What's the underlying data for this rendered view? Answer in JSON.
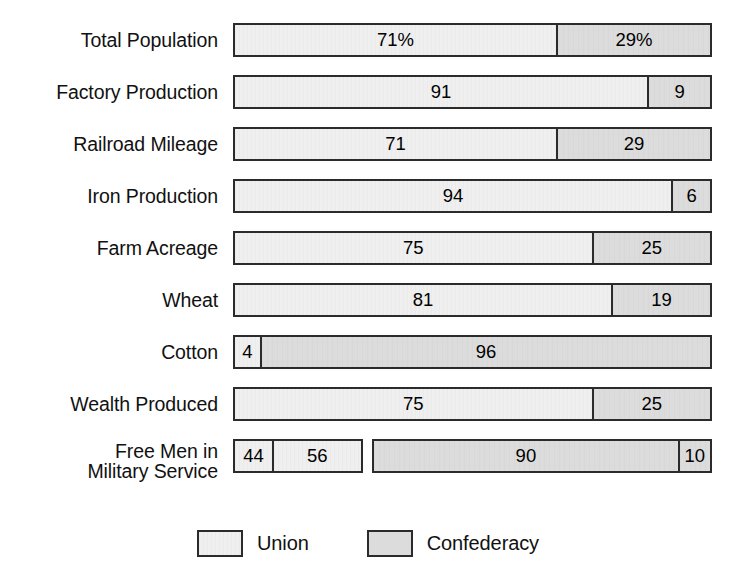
{
  "chart_data": {
    "type": "bar",
    "subtype": "stacked-horizontal-100-percent",
    "title": "",
    "xlabel": "",
    "ylabel": "",
    "xlim": [
      0,
      100
    ],
    "grid": false,
    "legend_position": "bottom-center",
    "units": "percent",
    "categories": [
      "Total Population",
      "Factory Production",
      "Railroad Mileage",
      "Iron Production",
      "Farm Acreage",
      "Wheat",
      "Cotton",
      "Wealth Produced",
      "Free Men in\nMilitary Service"
    ],
    "series": [
      {
        "name": "Union",
        "color": "#efefef",
        "values": [
          71,
          91,
          71,
          94,
          75,
          81,
          4,
          75,
          44
        ]
      },
      {
        "name": "Confederacy",
        "color": "#dcdcdc",
        "values": [
          29,
          9,
          29,
          6,
          25,
          19,
          96,
          25,
          56
        ]
      }
    ],
    "legend": [
      {
        "label": "Union",
        "color": "#efefef"
      },
      {
        "label": "Confederacy",
        "color": "#dcdcdc"
      }
    ]
  },
  "rows": [
    {
      "label": "Total Population",
      "groups": [
        {
          "start_pct": 0,
          "width_pct": 100,
          "segments": [
            {
              "party": "union",
              "label": "71%",
              "width_pct": 67.6
            },
            {
              "party": "confederacy",
              "label": "29%",
              "width_pct": 32.4
            }
          ]
        }
      ]
    },
    {
      "label": "Factory Production",
      "groups": [
        {
          "start_pct": 0,
          "width_pct": 100,
          "segments": [
            {
              "party": "union",
              "label": "91",
              "width_pct": 86.5
            },
            {
              "party": "confederacy",
              "label": "9",
              "width_pct": 13.5
            }
          ]
        }
      ]
    },
    {
      "label": "Railroad Mileage",
      "groups": [
        {
          "start_pct": 0,
          "width_pct": 100,
          "segments": [
            {
              "party": "union",
              "label": "71",
              "width_pct": 67.6
            },
            {
              "party": "confederacy",
              "label": "29",
              "width_pct": 32.4
            }
          ]
        }
      ]
    },
    {
      "label": "Iron Production",
      "groups": [
        {
          "start_pct": 0,
          "width_pct": 100,
          "segments": [
            {
              "party": "union",
              "label": "94",
              "width_pct": 91.5
            },
            {
              "party": "confederacy",
              "label": "6",
              "width_pct": 8.5
            }
          ]
        }
      ]
    },
    {
      "label": "Farm Acreage",
      "groups": [
        {
          "start_pct": 0,
          "width_pct": 100,
          "segments": [
            {
              "party": "union",
              "label": "75",
              "width_pct": 75.0
            },
            {
              "party": "confederacy",
              "label": "25",
              "width_pct": 25.0
            }
          ]
        }
      ]
    },
    {
      "label": "Wheat",
      "groups": [
        {
          "start_pct": 0,
          "width_pct": 100,
          "segments": [
            {
              "party": "union",
              "label": "81",
              "width_pct": 79.0
            },
            {
              "party": "confederacy",
              "label": "19",
              "width_pct": 21.0
            }
          ]
        }
      ]
    },
    {
      "label": "Cotton",
      "groups": [
        {
          "start_pct": 0,
          "width_pct": 100,
          "segments": [
            {
              "party": "union",
              "label": "4",
              "width_pct": 6.0
            },
            {
              "party": "confederacy",
              "label": "96",
              "width_pct": 94.0
            }
          ]
        }
      ]
    },
    {
      "label": "Wealth Produced",
      "groups": [
        {
          "start_pct": 0,
          "width_pct": 100,
          "segments": [
            {
              "party": "union",
              "label": "75",
              "width_pct": 75.0
            },
            {
              "party": "confederacy",
              "label": "25",
              "width_pct": 25.0
            }
          ]
        }
      ]
    },
    {
      "label": "Free Men in\nMilitary Service",
      "two_line": true,
      "groups": [
        {
          "start_pct": 0,
          "width_pct": 27.4,
          "segments": [
            {
              "party": "union",
              "label": "44",
              "width_pct": 31.0
            },
            {
              "party": "union",
              "label": "56",
              "width_pct": 69.0
            }
          ]
        },
        {
          "start_pct": 28.9,
          "width_pct": 71.1,
          "segments": [
            {
              "party": "confederacy",
              "label": "90",
              "width_pct": 90.0
            },
            {
              "party": "confederacy",
              "label": "10",
              "width_pct": 10.0
            }
          ]
        }
      ]
    }
  ],
  "legend": {
    "items": [
      {
        "key": "union",
        "label": "Union"
      },
      {
        "key": "confederacy",
        "label": "Confederacy"
      }
    ]
  }
}
